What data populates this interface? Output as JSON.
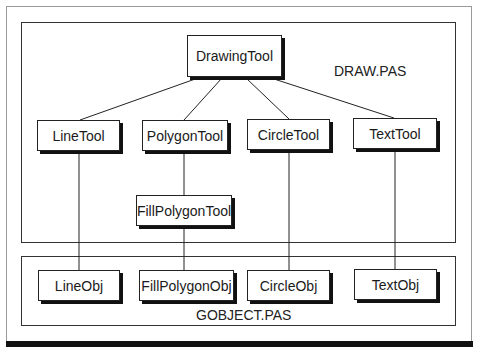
{
  "diagram": {
    "type": "class-hierarchy",
    "modules": [
      {
        "id": "draw",
        "label": "DRAW.PAS"
      },
      {
        "id": "gobject",
        "label": "GOBJECT.PAS"
      }
    ],
    "nodes": {
      "drawing_tool": "DrawingTool",
      "line_tool": "LineTool",
      "polygon_tool": "PolygonTool",
      "circle_tool": "CircleTool",
      "text_tool": "TextTool",
      "fill_polygon_tool": "FillPolygonTool",
      "line_obj": "LineObj",
      "fill_polygon_obj": "FillPolygonObj",
      "circle_obj": "CircleObj",
      "text_obj": "TextObj"
    },
    "edges": [
      {
        "from": "DrawingTool",
        "to": "LineTool"
      },
      {
        "from": "DrawingTool",
        "to": "PolygonTool"
      },
      {
        "from": "DrawingTool",
        "to": "CircleTool"
      },
      {
        "from": "DrawingTool",
        "to": "TextTool"
      },
      {
        "from": "PolygonTool",
        "to": "FillPolygonTool"
      },
      {
        "from": "LineTool",
        "to": "LineObj"
      },
      {
        "from": "FillPolygonTool",
        "to": "FillPolygonObj"
      },
      {
        "from": "CircleTool",
        "to": "CircleObj"
      },
      {
        "from": "TextTool",
        "to": "TextObj"
      }
    ]
  }
}
